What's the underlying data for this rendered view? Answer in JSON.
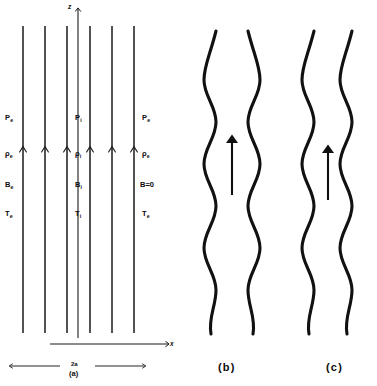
{
  "figure": {
    "background_color": "#ffffff",
    "line_color": "#1a1a1a",
    "panel_count": 3
  },
  "panel_a": {
    "label": "(a)",
    "caption": "Equilibrium magnetic slab: uniform vertical field lines inside and outside the slab",
    "axes": {
      "vertical_axis_label": "z",
      "horizontal_axis_label": "x",
      "vertical_axis_arrow": "up",
      "horizontal_axis_arrow": "right"
    },
    "width_annotation": {
      "label": "2a",
      "description": "slab full width measured between the inner boundaries"
    },
    "field_lines": {
      "count": 6,
      "direction": "upward",
      "arrowhead_row_y": 148,
      "x_positions": [
        23,
        45,
        67,
        90,
        112,
        134
      ]
    },
    "regions": [
      {
        "region": "exterior-left",
        "labels": [
          {
            "symbol": "P",
            "subscript": "e",
            "name": "pressure-external-left"
          },
          {
            "symbol": "ρ",
            "subscript": "e",
            "name": "density-external-left"
          },
          {
            "symbol": "B",
            "subscript": "e",
            "name": "field-external-left"
          },
          {
            "symbol": "T",
            "subscript": "e",
            "name": "temperature-external-left"
          }
        ]
      },
      {
        "region": "interior",
        "labels": [
          {
            "symbol": "P",
            "subscript": "i",
            "name": "pressure-internal"
          },
          {
            "symbol": "ρ",
            "subscript": "i",
            "name": "density-internal"
          },
          {
            "symbol": "B",
            "subscript": "i",
            "name": "field-internal"
          },
          {
            "symbol": "T",
            "subscript": "i",
            "name": "temperature-internal"
          }
        ]
      },
      {
        "region": "exterior-right",
        "labels": [
          {
            "symbol": "P",
            "subscript": "e",
            "name": "pressure-external-right"
          },
          {
            "symbol": "ρ",
            "subscript": "e",
            "name": "density-external-right"
          },
          {
            "symbol": "B=0",
            "subscript": "",
            "name": "field-external-right-zero"
          },
          {
            "symbol": "T",
            "subscript": "e",
            "name": "temperature-external-right"
          }
        ]
      }
    ],
    "label_rows_y": [
      119,
      155,
      186,
      215
    ]
  },
  "panel_b": {
    "label": "(b)",
    "mode_name": "sausage mode",
    "caption": "Symmetric (sausage) perturbation: the two slab boundaries oscillate in antiphase so the slab pinches and bulges",
    "boundary_phase": "antiphase",
    "arrow": {
      "direction": "up",
      "meaning": "background magnetic field direction"
    },
    "wave": {
      "wavelength_px": 98,
      "amplitude_px": 9,
      "boundary_count": 2
    }
  },
  "panel_c": {
    "label": "(c)",
    "mode_name": "kink mode",
    "caption": "Antisymmetric (kink) perturbation: both slab boundaries oscillate in phase so the slab sways laterally",
    "boundary_phase": "in-phase",
    "arrow": {
      "direction": "up",
      "meaning": "background magnetic field direction"
    },
    "wave": {
      "wavelength_px": 98,
      "amplitude_px": 9,
      "boundary_count": 2
    }
  }
}
